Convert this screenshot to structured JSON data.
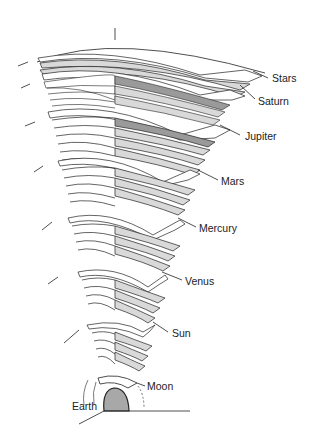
{
  "diagram": {
    "colors": {
      "line": "#222222",
      "shell_fill": "#d9d9d9",
      "shell_dark": "#9a9a9a",
      "earth_fill": "#a8a8a8",
      "background": "#ffffff"
    },
    "labels": [
      {
        "id": "stars",
        "text": "Stars",
        "x": 272,
        "y": 82
      },
      {
        "id": "saturn",
        "text": "Saturn",
        "x": 258,
        "y": 105
      },
      {
        "id": "jupiter",
        "text": "Jupiter",
        "x": 245,
        "y": 140
      },
      {
        "id": "mars",
        "text": "Mars",
        "x": 221,
        "y": 185
      },
      {
        "id": "mercury",
        "text": "Mercury",
        "x": 199,
        "y": 232
      },
      {
        "id": "venus",
        "text": "Venus",
        "x": 185,
        "y": 285
      },
      {
        "id": "sun",
        "text": "Sun",
        "x": 172,
        "y": 337
      },
      {
        "id": "moon",
        "text": "Moon",
        "x": 147,
        "y": 390
      },
      {
        "id": "earth",
        "text": "Earth",
        "x": 72,
        "y": 410
      }
    ]
  }
}
